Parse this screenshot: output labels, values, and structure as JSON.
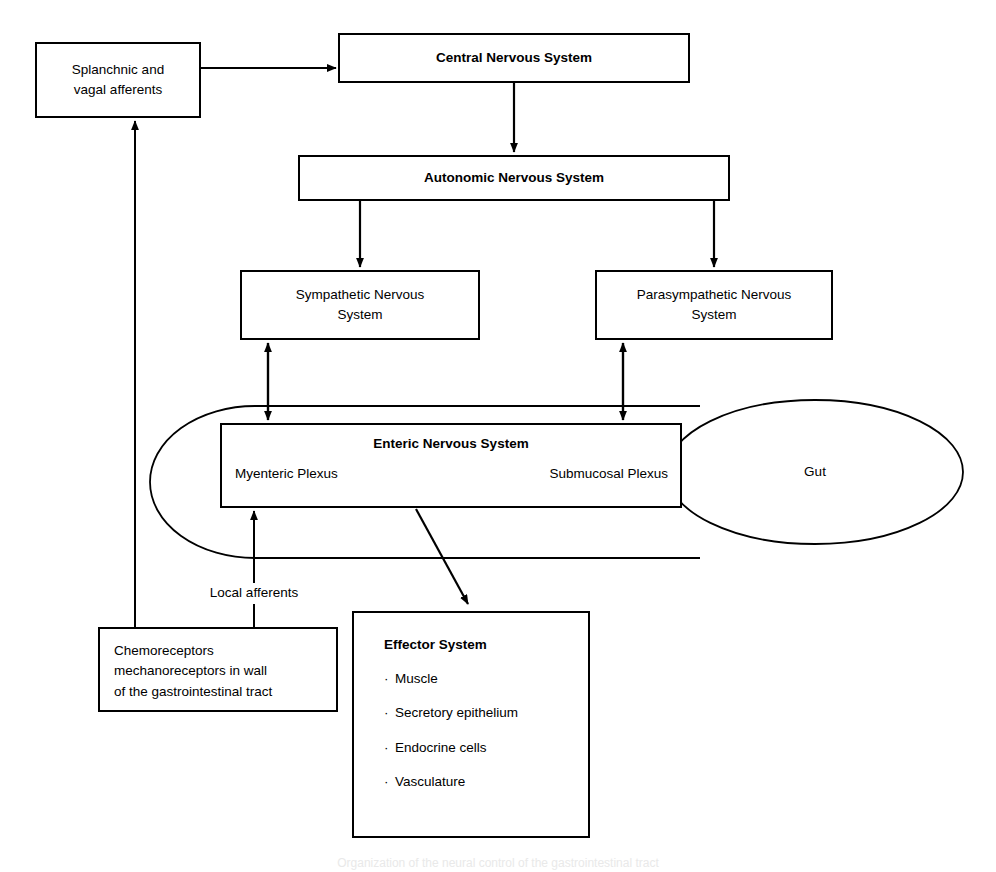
{
  "diagram": {
    "title": "Organization of the neural control of the gastrointestinal tract",
    "nodes": {
      "splanchnic": {
        "label": "Splanchnic and\nvagal afferents",
        "line1": "Splanchnic and",
        "line2": "vagal afferents"
      },
      "central_nervous_system": {
        "label": "Central Nervous System"
      },
      "autonomic_nervous_system": {
        "label": "Autonomic Nervous System"
      },
      "sympathetic": {
        "line1": "Sympathetic Nervous",
        "line2": "System"
      },
      "parasympathetic": {
        "line1": "Parasympathetic Nervous",
        "line2": "System"
      },
      "enteric_nervous_system": {
        "title": "Enteric Nervous System",
        "left_plexus": "Myenteric Plexus",
        "right_plexus": "Submucosal Plexus"
      },
      "gut": {
        "label": "Gut"
      },
      "effector_system": {
        "title": "Effector System",
        "bullet": "·",
        "items": [
          "Muscle",
          "Secretory epithelium",
          "Endocrine cells",
          "Vasculature"
        ]
      },
      "chemoreceptors": {
        "line1": "Chemoreceptors",
        "line2": "mechanoreceptors in wall",
        "line3": "of the gastrointestinal tract"
      }
    },
    "edge_labels": {
      "local_afferents": "Local afferents"
    },
    "colors": {
      "stroke": "#000000",
      "fill": "#ffffff",
      "text": "#000000"
    }
  }
}
